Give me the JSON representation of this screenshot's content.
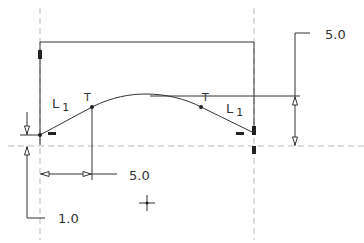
{
  "drawing": {
    "colors": {
      "line": "#333333",
      "dashed": "#bbbbbb",
      "background": "#ffffff"
    },
    "dimensions": {
      "height_top": "5.0",
      "width_horizontal": "5.0",
      "offset_left": "1.0"
    },
    "labels": {
      "left_line": "L",
      "left_line_sub": "1",
      "right_line": "L",
      "right_line_sub": "1",
      "tangent_left": "T",
      "tangent_right": "T"
    }
  }
}
